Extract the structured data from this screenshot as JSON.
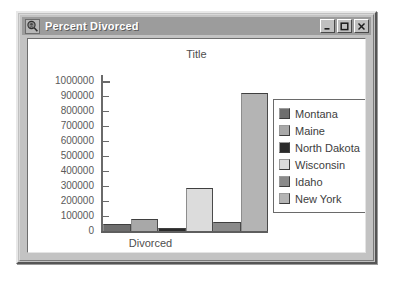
{
  "window": {
    "title": "Percent Divorced",
    "icon": "magnifier-chart-icon",
    "controls": {
      "minimize": "minimize-button",
      "maximize": "maximize-button",
      "close": "close-button"
    }
  },
  "chart_data": {
    "type": "bar",
    "title": "Title",
    "xlabel": "Divorced",
    "ylabel": "",
    "categories": [
      "Montana",
      "Maine",
      "North Dakota",
      "Wisconsin",
      "Idaho",
      "New York"
    ],
    "values": [
      48000,
      80000,
      22000,
      285000,
      60000,
      920000
    ],
    "colors": [
      "#6e6e6e",
      "#a8a8a8",
      "#2b2b2b",
      "#dcdcdc",
      "#8a8a8a",
      "#b4b4b4"
    ],
    "ylim": [
      0,
      1000000
    ],
    "yticks": [
      0,
      100000,
      200000,
      300000,
      400000,
      500000,
      600000,
      700000,
      800000,
      900000,
      1000000
    ],
    "ytick_labels": [
      "0",
      "100000",
      "200000",
      "300000",
      "400000",
      "500000",
      "600000",
      "700000",
      "800000",
      "900000",
      "1000000"
    ],
    "grid": false,
    "legend_position": "right",
    "legend_entries": [
      {
        "label": "Montana",
        "color": "#6e6e6e"
      },
      {
        "label": "Maine",
        "color": "#a8a8a8"
      },
      {
        "label": "North Dakota",
        "color": "#2b2b2b"
      },
      {
        "label": "Wisconsin",
        "color": "#dcdcdc"
      },
      {
        "label": "Idaho",
        "color": "#8a8a8a"
      },
      {
        "label": "New York",
        "color": "#b4b4b4"
      }
    ]
  }
}
